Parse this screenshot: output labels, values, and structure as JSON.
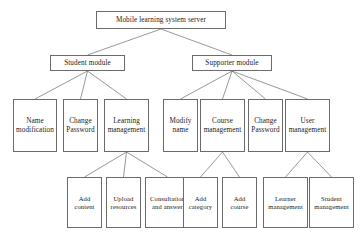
{
  "diagram": {
    "type": "tree-hierarchy",
    "canvas": {
      "width": 364,
      "height": 238
    },
    "style": {
      "box_border_color": "#6b6b6b",
      "box_fill_color": "#ffffff",
      "edge_color": "#6b6b6b",
      "text_color": "#1a1a1a",
      "background": "#ffffff"
    },
    "nodes": [
      {
        "id": "root",
        "label": "Mobile learning system server",
        "level": 0,
        "x": 96,
        "y": 11,
        "w": 130,
        "h": 18
      },
      {
        "id": "student",
        "label": "Student module",
        "level": 1,
        "x": 50,
        "y": 55,
        "w": 75,
        "h": 16
      },
      {
        "id": "supporter",
        "label": "Supporter module",
        "level": 1,
        "x": 192,
        "y": 55,
        "w": 80,
        "h": 16
      },
      {
        "id": "namemod",
        "label": "Name modification",
        "level": 2,
        "x": 13,
        "y": 99,
        "w": 44,
        "h": 53
      },
      {
        "id": "changepw1",
        "label": "Change Password",
        "level": 2,
        "x": 63,
        "y": 99,
        "w": 35,
        "h": 53
      },
      {
        "id": "learnmgmt",
        "label": "Learning management",
        "level": 2,
        "x": 104,
        "y": 99,
        "w": 45,
        "h": 53
      },
      {
        "id": "modifyname",
        "label": "Modify name",
        "level": 2,
        "x": 163,
        "y": 99,
        "w": 35,
        "h": 53
      },
      {
        "id": "coursemgmt",
        "label": "Course management",
        "level": 2,
        "x": 200,
        "y": 99,
        "w": 45,
        "h": 53
      },
      {
        "id": "changepw2",
        "label": "Change Password",
        "level": 2,
        "x": 248,
        "y": 99,
        "w": 35,
        "h": 53
      },
      {
        "id": "usermgmt",
        "label": "User management",
        "level": 2,
        "x": 285,
        "y": 99,
        "w": 45,
        "h": 53
      },
      {
        "id": "addcontent",
        "label": "Add content",
        "level": 3,
        "x": 67,
        "y": 177,
        "w": 35,
        "h": 51
      },
      {
        "id": "uploadres",
        "label": "Upload resources",
        "level": 3,
        "x": 106,
        "y": 177,
        "w": 35,
        "h": 51
      },
      {
        "id": "consult",
        "label": "Consultation and answer",
        "level": 3,
        "x": 145,
        "y": 177,
        "w": 45,
        "h": 51
      },
      {
        "id": "addcategory",
        "label": "Add category",
        "level": 3,
        "x": 183,
        "y": 177,
        "w": 35,
        "h": 51
      },
      {
        "id": "addcourse",
        "label": "Add course",
        "level": 3,
        "x": 222,
        "y": 177,
        "w": 35,
        "h": 51
      },
      {
        "id": "learnermgmt",
        "label": "Learner management",
        "level": 3,
        "x": 263,
        "y": 177,
        "w": 45,
        "h": 51
      },
      {
        "id": "studentmgmt",
        "label": "Student management",
        "level": 3,
        "x": 309,
        "y": 177,
        "w": 45,
        "h": 51
      }
    ],
    "edges": [
      {
        "from": "root",
        "to": "student"
      },
      {
        "from": "root",
        "to": "supporter"
      },
      {
        "from": "student",
        "to": "namemod"
      },
      {
        "from": "student",
        "to": "changepw1"
      },
      {
        "from": "student",
        "to": "learnmgmt"
      },
      {
        "from": "supporter",
        "to": "modifyname"
      },
      {
        "from": "supporter",
        "to": "coursemgmt"
      },
      {
        "from": "supporter",
        "to": "changepw2"
      },
      {
        "from": "supporter",
        "to": "usermgmt"
      },
      {
        "from": "learnmgmt",
        "to": "addcontent"
      },
      {
        "from": "learnmgmt",
        "to": "uploadres"
      },
      {
        "from": "learnmgmt",
        "to": "consult"
      },
      {
        "from": "coursemgmt",
        "to": "addcategory"
      },
      {
        "from": "coursemgmt",
        "to": "addcourse"
      },
      {
        "from": "usermgmt",
        "to": "learnermgmt"
      },
      {
        "from": "usermgmt",
        "to": "studentmgmt"
      }
    ]
  }
}
